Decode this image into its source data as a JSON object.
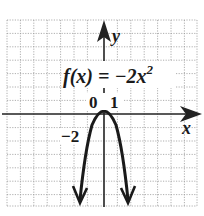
{
  "graph": {
    "function_label_prefix": "f(x) = −2x",
    "function_exponent": "2",
    "x_axis_label": "x",
    "y_axis_label": "y",
    "tick_labels": {
      "origin": "0",
      "x_one": "1",
      "y_neg_two": "−2"
    },
    "colors": {
      "curve": "#1a1a1a",
      "grid": "#9a9a9a",
      "axis": "#222222"
    }
  }
}
